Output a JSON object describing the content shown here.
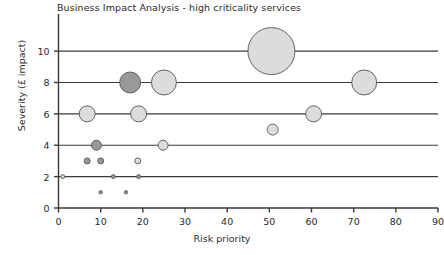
{
  "chart_data": {
    "type": "scatter",
    "title": "Business Impact Analysis - high criticality services",
    "xlabel": "Risk priority",
    "ylabel": "Severity (£ impact)",
    "xlim": [
      0,
      90
    ],
    "ylim": [
      0,
      11.6
    ],
    "xticks": [
      0,
      10,
      20,
      30,
      40,
      50,
      60,
      70,
      80,
      90
    ],
    "yticks": [
      0,
      2,
      4,
      6,
      8,
      10
    ],
    "xtick_labels": [
      "0",
      "10",
      "20",
      "30",
      "40",
      "50",
      "60",
      "70",
      "80",
      "90"
    ],
    "ytick_labels": [
      "0",
      "2",
      "4",
      "6",
      "8",
      "10"
    ],
    "grid": "horizontal gridlines at severity 2, 4, 6, 8, 10",
    "legend": "none",
    "bubble_note": "bubble area encodes relative business impact; two shades used",
    "colors": {
      "bubble_light": "#dcdcdc",
      "bubble_dark": "#999999",
      "bubble_stroke": "#555555",
      "axis": "#3a3a3a",
      "gridline": "#3a3a3a",
      "background": "#ffffff",
      "text": "#2b2b2b"
    },
    "points": [
      {
        "x": 50.5,
        "y": 10,
        "r": 23.5,
        "shade": "light"
      },
      {
        "x": 17.0,
        "y": 8,
        "r": 10.5,
        "shade": "dark"
      },
      {
        "x": 25.0,
        "y": 8,
        "r": 12.5,
        "shade": "light"
      },
      {
        "x": 72.5,
        "y": 8,
        "r": 12.5,
        "shade": "light"
      },
      {
        "x": 6.8,
        "y": 6,
        "r": 8.0,
        "shade": "light"
      },
      {
        "x": 19.0,
        "y": 6,
        "r": 8.0,
        "shade": "light"
      },
      {
        "x": 60.5,
        "y": 6,
        "r": 8.0,
        "shade": "light"
      },
      {
        "x": 50.8,
        "y": 5,
        "r": 5.5,
        "shade": "light"
      },
      {
        "x": 9.0,
        "y": 4,
        "r": 5.0,
        "shade": "dark"
      },
      {
        "x": 24.8,
        "y": 4,
        "r": 5.0,
        "shade": "light"
      },
      {
        "x": 6.8,
        "y": 3,
        "r": 3.0,
        "shade": "dark"
      },
      {
        "x": 10.0,
        "y": 3,
        "r": 3.0,
        "shade": "dark"
      },
      {
        "x": 18.8,
        "y": 3,
        "r": 3.0,
        "shade": "light"
      },
      {
        "x": 1.0,
        "y": 2,
        "r": 2.0,
        "shade": "light"
      },
      {
        "x": 13.0,
        "y": 2,
        "r": 2.0,
        "shade": "dark"
      },
      {
        "x": 19.0,
        "y": 2,
        "r": 2.0,
        "shade": "dark"
      },
      {
        "x": 10.0,
        "y": 1,
        "r": 1.7,
        "shade": "dark"
      },
      {
        "x": 16.0,
        "y": 1,
        "r": 1.7,
        "shade": "dark"
      }
    ]
  }
}
